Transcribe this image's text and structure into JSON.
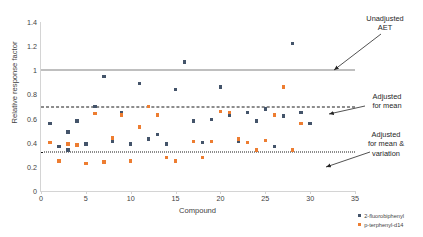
{
  "chart_data": {
    "type": "scatter",
    "title": "",
    "xlabel": "Compound",
    "ylabel": "Relative response factor",
    "xlim": [
      0,
      35
    ],
    "ylim": [
      0,
      1.4
    ],
    "xticks": [
      "0",
      "5",
      "10",
      "15",
      "20",
      "25",
      "30",
      "35"
    ],
    "yticks": [
      "0",
      "0.2",
      "0.4",
      "0.6",
      "0.8",
      "1",
      "1.2",
      "1.4"
    ],
    "grid": false,
    "legend_position": "bottom-right",
    "series": [
      {
        "name": "2-fluorobiphenyl",
        "color": "#44546A",
        "points": [
          {
            "x": 1,
            "y": 0.56
          },
          {
            "x": 2,
            "y": 0.37
          },
          {
            "x": 3,
            "y": 0.49
          },
          {
            "x": 3,
            "y": 0.34
          },
          {
            "x": 4,
            "y": 0.58
          },
          {
            "x": 5,
            "y": 0.39
          },
          {
            "x": 6,
            "y": 0.7
          },
          {
            "x": 7,
            "y": 0.95
          },
          {
            "x": 8,
            "y": 0.41
          },
          {
            "x": 9,
            "y": 0.65
          },
          {
            "x": 10,
            "y": 0.39
          },
          {
            "x": 11,
            "y": 0.89
          },
          {
            "x": 12,
            "y": 0.43
          },
          {
            "x": 13,
            "y": 0.47
          },
          {
            "x": 14,
            "y": 0.39
          },
          {
            "x": 15,
            "y": 0.84
          },
          {
            "x": 16,
            "y": 1.07
          },
          {
            "x": 17,
            "y": 0.58
          },
          {
            "x": 18,
            "y": 0.4
          },
          {
            "x": 19,
            "y": 0.59
          },
          {
            "x": 20,
            "y": 0.86
          },
          {
            "x": 21,
            "y": 0.63
          },
          {
            "x": 22,
            "y": 0.41
          },
          {
            "x": 23,
            "y": 0.65
          },
          {
            "x": 24,
            "y": 0.58
          },
          {
            "x": 25,
            "y": 0.68
          },
          {
            "x": 26,
            "y": 0.37
          },
          {
            "x": 27,
            "y": 0.62
          },
          {
            "x": 28,
            "y": 1.22
          },
          {
            "x": 29,
            "y": 0.65
          },
          {
            "x": 30,
            "y": 0.56
          }
        ]
      },
      {
        "name": "p-terphenyl-d14",
        "color": "#ED7D31",
        "points": [
          {
            "x": 1,
            "y": 0.4
          },
          {
            "x": 2,
            "y": 0.25
          },
          {
            "x": 3,
            "y": 0.39
          },
          {
            "x": 4,
            "y": 0.38
          },
          {
            "x": 5,
            "y": 0.23
          },
          {
            "x": 6,
            "y": 0.64
          },
          {
            "x": 7,
            "y": 0.24
          },
          {
            "x": 8,
            "y": 0.44
          },
          {
            "x": 9,
            "y": 0.63
          },
          {
            "x": 10,
            "y": 0.25
          },
          {
            "x": 11,
            "y": 0.53
          },
          {
            "x": 12,
            "y": 0.7
          },
          {
            "x": 13,
            "y": 0.63
          },
          {
            "x": 14,
            "y": 0.28
          },
          {
            "x": 15,
            "y": 0.25
          },
          {
            "x": 17,
            "y": 0.41
          },
          {
            "x": 18,
            "y": 0.28
          },
          {
            "x": 19,
            "y": 0.41
          },
          {
            "x": 20,
            "y": 0.66
          },
          {
            "x": 21,
            "y": 0.65
          },
          {
            "x": 22,
            "y": 0.43
          },
          {
            "x": 23,
            "y": 0.4
          },
          {
            "x": 24,
            "y": 0.34
          },
          {
            "x": 25,
            "y": 0.42
          },
          {
            "x": 26,
            "y": 0.63
          },
          {
            "x": 27,
            "y": 0.86
          },
          {
            "x": 28,
            "y": 0.34
          },
          {
            "x": 29,
            "y": 0.56
          }
        ]
      }
    ],
    "reference_lines": [
      {
        "id": "unadjusted",
        "value": 1.0,
        "style": "solid",
        "color": "#808080",
        "label": "Unadjusted\nAET"
      },
      {
        "id": "mean",
        "value": 0.7,
        "style": "dashed",
        "color": "#1a1a1a",
        "label": "Adjusted\nfor mean"
      },
      {
        "id": "meanvar",
        "value": 0.32,
        "style": "dotted",
        "color": "#1a1a1a",
        "label": "Adjusted\nfor mean &\nvariation"
      }
    ]
  }
}
